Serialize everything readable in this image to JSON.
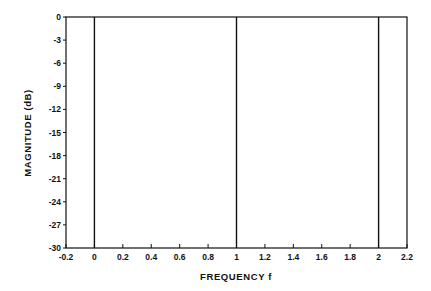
{
  "chart_data": {
    "type": "line",
    "title": "",
    "xlabel": "FREQUENCY f",
    "ylabel": "MAGNITUDE (dB)",
    "xlim": [
      -0.2,
      2.2
    ],
    "ylim": [
      -30,
      0
    ],
    "xticks": [
      -0.2,
      0,
      0.2,
      0.4,
      0.6,
      0.8,
      1,
      1.2,
      1.4,
      1.6,
      1.8,
      2,
      2.2
    ],
    "xtick_labels": [
      "-0.2",
      "0",
      "0.2",
      "0.4",
      "0.6",
      "0.8",
      "1",
      "1.2",
      "1.4",
      "1.6",
      "1.8",
      "2",
      "2.2"
    ],
    "yticks": [
      0,
      -3,
      -6,
      -9,
      -12,
      -15,
      -18,
      -21,
      -24,
      -27,
      -30
    ],
    "ytick_labels": [
      "0",
      "-3",
      "-6",
      "-9",
      "-12",
      "-15",
      "-18",
      "-21",
      "-24",
      "-27",
      "-30"
    ],
    "grid": false,
    "legend": null,
    "series": [
      {
        "name": "magnitude response",
        "description": "vertical impulse lines spanning full range at integer frequencies",
        "lines": [
          {
            "x": 0,
            "y_from": -30,
            "y_to": 0
          },
          {
            "x": 1,
            "y_from": -30,
            "y_to": 0
          },
          {
            "x": 2,
            "y_from": -30,
            "y_to": 0
          }
        ]
      }
    ],
    "colors": {
      "line": "#111111",
      "axes": "#111111",
      "background": "#ffffff"
    }
  }
}
